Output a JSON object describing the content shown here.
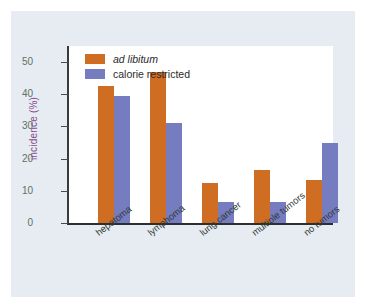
{
  "chart_data": {
    "type": "bar",
    "title": "",
    "xlabel": "",
    "ylabel": "incidence (%)",
    "categories": [
      "hepatoma",
      "lymphoma",
      "lung cancer",
      "multiple tumors",
      "no tumors"
    ],
    "series": [
      {
        "name": "ad libitum",
        "color": "#cf6d22",
        "values": [
          42.5,
          47,
          12.5,
          16.5,
          13.5
        ]
      },
      {
        "name": "calorie restricted",
        "color": "#767cc0",
        "values": [
          39.5,
          31,
          6.5,
          6.5,
          25
        ]
      }
    ],
    "ylim": [
      0,
      55
    ],
    "yticks": [
      0,
      10,
      20,
      30,
      40,
      50
    ],
    "ytick_labels": [
      "0",
      "10",
      "20",
      "30",
      "40",
      "50"
    ],
    "grid": false,
    "legend_position": "top-left",
    "legend_entries": [
      {
        "label": "ad libitum",
        "style": "italic",
        "color": "#cf6d22"
      },
      {
        "label": "calorie restricted",
        "style": "normal",
        "color": "#767cc0"
      }
    ]
  },
  "colors": {
    "figure_background": "#e6ecf2",
    "plot_background": "#ffffff",
    "ad_libitum": "#cf6d22",
    "calorie_restricted": "#767cc0",
    "ytick_label": "#5d7263",
    "ylabel": "#8a4a8f",
    "xtick_label": "#303a33",
    "axis": "#2e2e2e"
  }
}
